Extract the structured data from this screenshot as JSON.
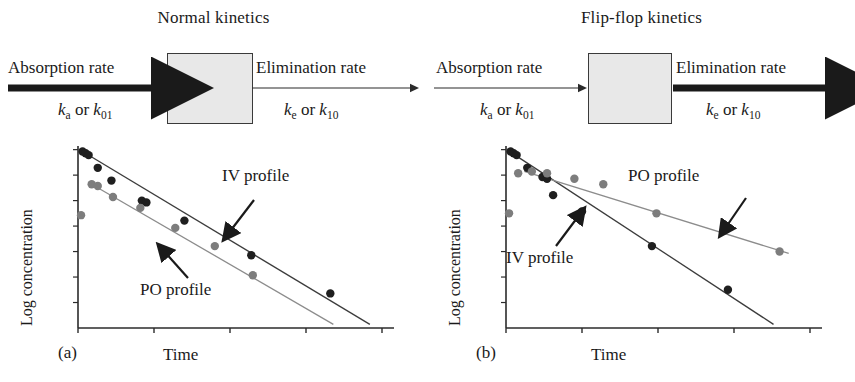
{
  "figure": {
    "panels": [
      {
        "tag": "(a)",
        "schematic": {
          "title": "Normal kinetics",
          "absorption_label": "Absorption rate",
          "absorption_k": "k",
          "absorption_k_sub": "a",
          "absorption_or": " or ",
          "absorption_k2": "k",
          "absorption_k2_sub": "01",
          "elimination_label": "Elimination rate",
          "elimination_k": "k",
          "elimination_k_sub": "e",
          "elimination_or": " or ",
          "elimination_k2": "k",
          "elimination_k2_sub": "10",
          "absorption_arrow_weight": "thick",
          "elimination_arrow_weight": "thin"
        },
        "plot": {
          "ylabel": "Log concentration",
          "xlabel": "Time",
          "annotations": [
            {
              "text": "IV profile"
            },
            {
              "text": "PO profile"
            }
          ]
        }
      },
      {
        "tag": "(b)",
        "schematic": {
          "title": "Flip-flop kinetics",
          "absorption_label": "Absorption rate",
          "absorption_k": "k",
          "absorption_k_sub": "a",
          "absorption_or": " or ",
          "absorption_k2": "k",
          "absorption_k2_sub": "01",
          "elimination_label": "Elimination rate",
          "elimination_k": "k",
          "elimination_k_sub": "e",
          "elimination_or": " or ",
          "elimination_k2": "k",
          "elimination_k2_sub": "10",
          "absorption_arrow_weight": "thin",
          "elimination_arrow_weight": "thick"
        },
        "plot": {
          "ylabel": "Log concentration",
          "xlabel": "Time",
          "annotations": [
            {
              "text": "PO profile"
            },
            {
              "text": "IV profile"
            }
          ]
        }
      }
    ]
  },
  "colors": {
    "iv_marker": "#1f1f1f",
    "po_marker": "#7d7d7d",
    "iv_line": "#3c3c3c",
    "po_line": "#8c8c8c",
    "axis": "#2b2b2b",
    "box_fill": "#e8e8e8",
    "box_stroke": "#3a3a3a",
    "text": "#1a1a1a"
  },
  "chart_data": [
    {
      "type": "scatter",
      "panel": "(a)",
      "title": "Normal kinetics semi-log plot",
      "xlabel": "Time",
      "ylabel": "Log concentration",
      "xlim": [
        0,
        100
      ],
      "ylim": [
        0,
        100
      ],
      "grid": false,
      "legend_position": "inline-annotation",
      "series": [
        {
          "name": "IV profile",
          "color": "#1f1f1f",
          "points": [
            {
              "x": 1.5,
              "y": 97
            },
            {
              "x": 2.5,
              "y": 96
            },
            {
              "x": 3.5,
              "y": 95
            },
            {
              "x": 6.5,
              "y": 88
            },
            {
              "x": 11.0,
              "y": 81
            },
            {
              "x": 21.0,
              "y": 70
            },
            {
              "x": 22.5,
              "y": 69
            },
            {
              "x": 35.0,
              "y": 59
            },
            {
              "x": 57.0,
              "y": 40
            },
            {
              "x": 83.0,
              "y": 19
            }
          ],
          "fit_line": {
            "x0": 1.5,
            "y0": 97,
            "x1": 96.0,
            "y1": 2.0
          }
        },
        {
          "name": "PO profile",
          "color": "#7d7d7d",
          "points": [
            {
              "x": 1.0,
              "y": 62
            },
            {
              "x": 4.5,
              "y": 79
            },
            {
              "x": 6.5,
              "y": 78
            },
            {
              "x": 11.5,
              "y": 72
            },
            {
              "x": 20.5,
              "y": 66
            },
            {
              "x": 32.0,
              "y": 55
            },
            {
              "x": 45.0,
              "y": 45
            },
            {
              "x": 57.5,
              "y": 29
            }
          ],
          "fit_line": {
            "x0": 4.5,
            "y0": 79,
            "x1": 84.0,
            "y1": 2.0
          }
        }
      ]
    },
    {
      "type": "scatter",
      "panel": "(b)",
      "title": "Flip-flop kinetics semi-log plot",
      "xlabel": "Time",
      "ylabel": "Log concentration",
      "xlim": [
        0,
        100
      ],
      "ylim": [
        0,
        100
      ],
      "grid": false,
      "legend_position": "inline-annotation",
      "series": [
        {
          "name": "IV profile",
          "color": "#1f1f1f",
          "points": [
            {
              "x": 1.5,
              "y": 97
            },
            {
              "x": 2.5,
              "y": 96
            },
            {
              "x": 3.5,
              "y": 95
            },
            {
              "x": 7.0,
              "y": 88
            },
            {
              "x": 12.0,
              "y": 83
            },
            {
              "x": 13.5,
              "y": 82
            },
            {
              "x": 15.5,
              "y": 73
            },
            {
              "x": 25.0,
              "y": 64
            },
            {
              "x": 48.0,
              "y": 45
            },
            {
              "x": 73.0,
              "y": 21
            }
          ],
          "fit_line": {
            "x0": 3.0,
            "y0": 95,
            "x1": 88.0,
            "y1": 2.0
          }
        },
        {
          "name": "PO profile",
          "color": "#7d7d7d",
          "points": [
            {
              "x": 1.0,
              "y": 63
            },
            {
              "x": 4.0,
              "y": 85
            },
            {
              "x": 8.5,
              "y": 86
            },
            {
              "x": 13.5,
              "y": 85
            },
            {
              "x": 22.5,
              "y": 82
            },
            {
              "x": 32.0,
              "y": 79
            },
            {
              "x": 49.5,
              "y": 63
            },
            {
              "x": 90.0,
              "y": 42
            }
          ],
          "fit_line": {
            "x0": 6.0,
            "y0": 86,
            "x1": 93.0,
            "y1": 41.0
          }
        }
      ]
    }
  ]
}
